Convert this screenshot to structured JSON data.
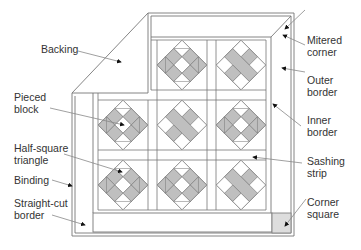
{
  "diagram": {
    "colors": {
      "line": "#777777",
      "fill_gray": "#bfbfbf",
      "corner_fill": "#dddddd",
      "text": "#333333"
    }
  },
  "labels": {
    "backing": [
      "Backing"
    ],
    "pieced_block": [
      "Pieced",
      "block"
    ],
    "half_square_triangle": [
      "Half-square",
      "triangle"
    ],
    "binding": [
      "Binding"
    ],
    "straight_cut_border": [
      "Straight-cut",
      "border"
    ],
    "mitered_corner": [
      "Mitered",
      "corner"
    ],
    "outer_border": [
      "Outer",
      "border"
    ],
    "inner_border": [
      "Inner",
      "border"
    ],
    "sashing_strip": [
      "Sashing",
      "strip"
    ],
    "corner_square": [
      "Corner",
      "square"
    ]
  },
  "blocks": [
    {
      "row": 0,
      "col": 0,
      "pattern": "hidden-by-backing"
    },
    {
      "row": 0,
      "col": 1,
      "pattern": "ring"
    },
    {
      "row": 0,
      "col": 2,
      "pattern": "chain"
    },
    {
      "row": 1,
      "col": 0,
      "pattern": "ring"
    },
    {
      "row": 1,
      "col": 1,
      "pattern": "chain"
    },
    {
      "row": 1,
      "col": 2,
      "pattern": "ring"
    },
    {
      "row": 2,
      "col": 0,
      "pattern": "ring"
    },
    {
      "row": 2,
      "col": 1,
      "pattern": "ring"
    },
    {
      "row": 2,
      "col": 2,
      "pattern": "chain"
    }
  ]
}
